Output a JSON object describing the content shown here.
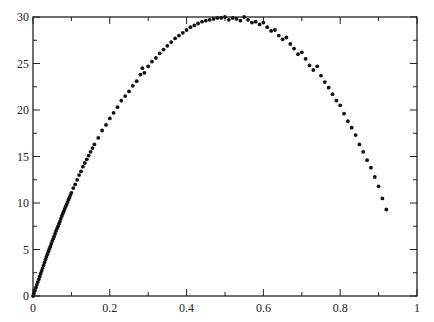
{
  "chart_data": {
    "type": "scatter",
    "title": "",
    "xlabel": "",
    "ylabel": "",
    "xlim": [
      0,
      1
    ],
    "ylim": [
      0,
      30
    ],
    "grid": false,
    "legend": null,
    "x_ticks": [
      0,
      0.2,
      0.4,
      0.6,
      0.8,
      1
    ],
    "x_tick_labels": [
      "0",
      "0.2",
      "0.4",
      "0.6",
      "0.8",
      "1"
    ],
    "x_minor_ticks": [
      0.1,
      0.3,
      0.5,
      0.7,
      0.9
    ],
    "y_ticks": [
      0,
      5,
      10,
      15,
      20,
      25,
      30
    ],
    "y_tick_labels": [
      "0",
      "5",
      "10",
      "15",
      "20",
      "25",
      "30"
    ],
    "y_minor_ticks": [
      2.5,
      7.5,
      12.5,
      17.5,
      22.5,
      27.5
    ],
    "marker_color": "#111111",
    "series": [
      {
        "name": "data",
        "x": [
          0.0,
          0.005,
          0.01,
          0.015,
          0.02,
          0.025,
          0.03,
          0.035,
          0.04,
          0.045,
          0.05,
          0.055,
          0.06,
          0.065,
          0.07,
          0.075,
          0.08,
          0.085,
          0.09,
          0.095,
          0.1,
          0.105,
          0.11,
          0.115,
          0.12,
          0.125,
          0.13,
          0.135,
          0.14,
          0.145,
          0.15,
          0.155,
          0.16,
          0.17,
          0.18,
          0.19,
          0.2,
          0.21,
          0.22,
          0.23,
          0.24,
          0.25,
          0.26,
          0.27,
          0.28,
          0.285,
          0.29,
          0.3,
          0.31,
          0.32,
          0.33,
          0.34,
          0.35,
          0.36,
          0.37,
          0.38,
          0.39,
          0.4,
          0.41,
          0.42,
          0.43,
          0.44,
          0.45,
          0.46,
          0.47,
          0.48,
          0.49,
          0.5,
          0.51,
          0.52,
          0.53,
          0.54,
          0.55,
          0.56,
          0.57,
          0.58,
          0.59,
          0.6,
          0.61,
          0.62,
          0.63,
          0.64,
          0.65,
          0.66,
          0.67,
          0.68,
          0.69,
          0.7,
          0.71,
          0.72,
          0.73,
          0.74,
          0.75,
          0.76,
          0.77,
          0.78,
          0.79,
          0.8,
          0.81,
          0.82,
          0.83,
          0.84,
          0.85,
          0.86,
          0.87,
          0.88,
          0.89,
          0.9,
          0.91,
          0.92
        ],
        "y": [
          0.0,
          0.6,
          1.2,
          1.8,
          2.4,
          3.0,
          3.6,
          4.2,
          4.8,
          5.3,
          5.9,
          6.4,
          7.0,
          7.5,
          8.0,
          8.6,
          9.1,
          9.6,
          10.1,
          10.6,
          11.1,
          11.6,
          12.0,
          12.5,
          13.0,
          13.4,
          13.9,
          14.3,
          14.7,
          15.1,
          15.5,
          15.9,
          16.3,
          17.0,
          17.8,
          18.4,
          19.1,
          19.7,
          20.3,
          21.0,
          21.5,
          22.0,
          22.6,
          23.1,
          23.8,
          24.5,
          24.0,
          24.7,
          25.2,
          25.6,
          26.1,
          26.5,
          26.9,
          27.3,
          27.7,
          28.0,
          28.3,
          28.6,
          28.9,
          29.1,
          29.3,
          29.5,
          29.6,
          29.7,
          29.8,
          29.9,
          29.9,
          30.0,
          29.7,
          29.9,
          29.8,
          29.6,
          30.0,
          29.7,
          29.4,
          29.5,
          29.2,
          29.4,
          28.9,
          28.5,
          28.6,
          28.0,
          27.6,
          27.8,
          27.1,
          26.6,
          26.0,
          26.2,
          25.5,
          24.8,
          24.3,
          24.7,
          23.7,
          23.0,
          22.4,
          21.7,
          21.0,
          20.5,
          19.6,
          18.8,
          18.1,
          17.3,
          16.3,
          15.5,
          14.6,
          13.8,
          12.8,
          11.8,
          10.5,
          9.3
        ]
      }
    ]
  }
}
